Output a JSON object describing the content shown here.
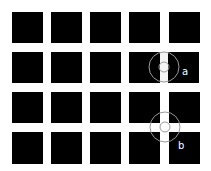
{
  "figure": {
    "grid": {
      "rows": 4,
      "columns": 5
    },
    "colors": {
      "background": "#ffffff",
      "square": "#000000",
      "street": "#f4f4f4",
      "circle": "#9a9a9a"
    },
    "annotations": [
      {
        "id": "a",
        "label": "a",
        "location": "row 2, between columns 4 and 5 (vertical street only)"
      },
      {
        "id": "b",
        "label": "b",
        "location": "intersection of rows 3-4 and columns 4-5"
      }
    ]
  }
}
